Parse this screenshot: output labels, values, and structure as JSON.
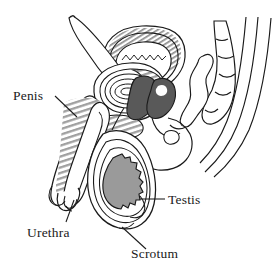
{
  "figure": {
    "background_color": "#ffffff",
    "width": 278,
    "height": 273,
    "line_color": "#1a1a1a",
    "label_color": "#1a1a1a"
  },
  "labels": [
    {
      "id": "penis",
      "text": "Penis",
      "x": 13,
      "y": 100,
      "anchor": "start",
      "leader": "M 55 96 L 77 117",
      "leader_style": "line"
    },
    {
      "id": "urethra",
      "text": "Urethra",
      "x": 27,
      "y": 237,
      "anchor": "start",
      "leader": "M 66 222 L 74 200",
      "leader_style": "line"
    },
    {
      "id": "testis",
      "text": "Testis",
      "x": 168,
      "y": 204,
      "anchor": "start",
      "leader": "M 140 199 L 165 199",
      "leader_style": "line"
    },
    {
      "id": "scrotum",
      "text": "Scrotum",
      "x": 131,
      "y": 258,
      "anchor": "start",
      "leader": "M 122 227 L 146 249",
      "leader_style": "line"
    }
  ],
  "structures": [
    {
      "id": "bladder",
      "name": "bladder",
      "fill": "#ffffff",
      "hatch": "gray-diagonal"
    },
    {
      "id": "prostate",
      "name": "prostate",
      "fill": "#595959"
    },
    {
      "id": "seminal-vesicle",
      "name": "seminal-vesicle",
      "fill": "#595959"
    },
    {
      "id": "testis-body",
      "name": "testis",
      "fill": "#9a9a9a"
    },
    {
      "id": "penis-shaft",
      "name": "penis-shaft",
      "fill": "#ffffff",
      "hatch": "gray-bands"
    },
    {
      "id": "epididymis-coil",
      "name": "epididymis-coil",
      "fill": "#ffffff"
    },
    {
      "id": "vas-deferens",
      "name": "vas-deferens",
      "fill": "#ffffff"
    },
    {
      "id": "scrotum-sac",
      "name": "scrotum",
      "fill": "#ffffff"
    },
    {
      "id": "spine",
      "name": "sacrum-vertebrae",
      "fill": "#ffffff"
    },
    {
      "id": "rectum",
      "name": "rectum",
      "fill": "#ffffff"
    },
    {
      "id": "buttock",
      "name": "buttock-contour",
      "fill": "#ffffff"
    }
  ],
  "colors": {
    "outline": "#1a1a1a",
    "organ_dark": "#595959",
    "organ_mid": "#9a9a9a",
    "hatch_gray": "#8c8c8c",
    "hatch_light": "#b8b8b8",
    "page": "#ffffff"
  }
}
